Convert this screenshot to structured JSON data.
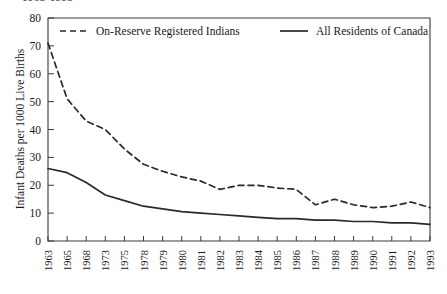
{
  "figure": {
    "clipped_title": "1963-1993",
    "ylabel": "Infant Deaths per 1000 Live Births",
    "frame_color": "#3a3a3a",
    "line_color": "#2a2a2a"
  },
  "legend": {
    "position": "top-inside",
    "entries": [
      {
        "label": "On-Reserve Registered Indians",
        "style": "dashed"
      },
      {
        "label": "All Residents of Canada",
        "style": "solid"
      }
    ]
  },
  "chart_data": {
    "type": "line",
    "title": "1963-1993",
    "xlabel": "",
    "ylabel": "Infant Deaths per 1000 Live Births",
    "ylim": [
      0,
      80
    ],
    "yticks": [
      0,
      10,
      20,
      30,
      40,
      50,
      60,
      70,
      80
    ],
    "grid": false,
    "legend_position": "top-inside",
    "categories": [
      "1963",
      "1965",
      "1968",
      "1973",
      "1975",
      "1978",
      "1979",
      "1980",
      "1981",
      "1982",
      "1983",
      "1984",
      "1985",
      "1986",
      "1987",
      "1988",
      "1989",
      "1990",
      "1991",
      "1992",
      "1993"
    ],
    "series": [
      {
        "name": "On-Reserve Registered Indians",
        "style": "dashed",
        "values": [
          71,
          51,
          43,
          40,
          33,
          27.5,
          25,
          23,
          21.5,
          18.5,
          20,
          20,
          19,
          18.5,
          13,
          15,
          13,
          12,
          12.5,
          14,
          12
        ]
      },
      {
        "name": "All Residents of Canada",
        "style": "solid",
        "values": [
          26,
          24.5,
          21,
          16.5,
          14.5,
          12.5,
          11.5,
          10.5,
          10,
          9.5,
          9,
          8.5,
          8,
          8,
          7.5,
          7.5,
          7,
          7,
          6.5,
          6.5,
          6
        ]
      }
    ]
  }
}
